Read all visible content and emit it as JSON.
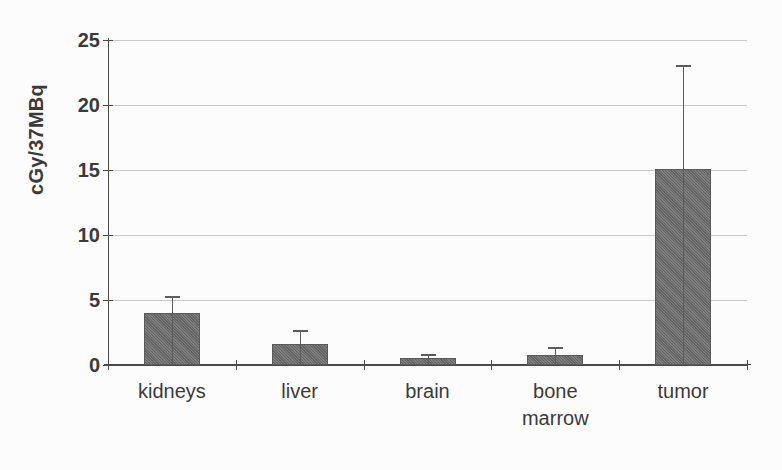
{
  "chart_data": {
    "type": "bar",
    "title": "",
    "xlabel": "",
    "ylabel": "cGy/37MBq",
    "ylim": [
      0,
      25
    ],
    "yticks": [
      0,
      5,
      10,
      15,
      20,
      25
    ],
    "ytick_labels": [
      "0",
      "5",
      "10",
      "15",
      "20",
      "25"
    ],
    "grid": true,
    "legend": "none",
    "categories": [
      "kidneys",
      "liver",
      "brain",
      "bone marrow",
      "tumor"
    ],
    "category_lines": [
      [
        "kidneys"
      ],
      [
        "liver"
      ],
      [
        "brain"
      ],
      [
        "bone",
        "marrow"
      ],
      [
        "tumor"
      ]
    ],
    "values": [
      4.0,
      1.6,
      0.55,
      0.8,
      15.1
    ],
    "errors": [
      1.3,
      1.1,
      0.3,
      0.6,
      8.0
    ],
    "error_upper": [
      5.3,
      2.7,
      0.85,
      1.4,
      23.1
    ],
    "series": [
      {
        "name": "absorbed dose",
        "values": [
          4.0,
          1.6,
          0.55,
          0.8,
          15.1
        ],
        "errors": [
          1.3,
          1.1,
          0.3,
          0.6,
          8.0
        ]
      }
    ]
  },
  "style": {
    "bar_fill": "#6f6f6f",
    "bar_edge": "#5a5a5a",
    "axis_color": "#4a4a4a",
    "grid_color": "#bfbfbf",
    "text_color": "#3a3a3a",
    "background": "#fcfcfc"
  }
}
